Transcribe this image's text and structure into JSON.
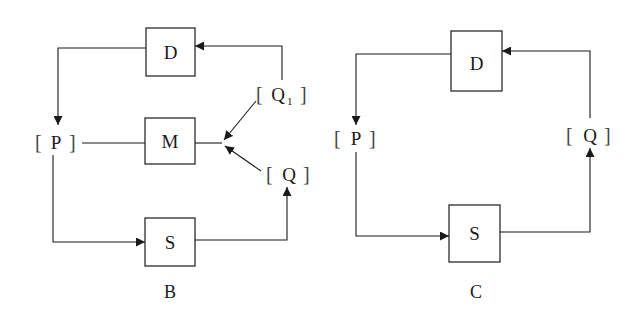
{
  "diagrams": [
    {
      "caption": "B",
      "boxes": {
        "d": "D",
        "m": "M",
        "s": "S"
      },
      "nodes": {
        "p": "P",
        "q1": "Q",
        "q1_sub": "1",
        "q": "Q"
      }
    },
    {
      "caption": "C",
      "boxes": {
        "d": "D",
        "s": "S"
      },
      "nodes": {
        "p": "P",
        "q": "Q"
      }
    }
  ],
  "brackets": {
    "open": "[",
    "close": "]"
  },
  "colors": {
    "stroke": "#1a1a1a",
    "background": "#ffffff"
  }
}
